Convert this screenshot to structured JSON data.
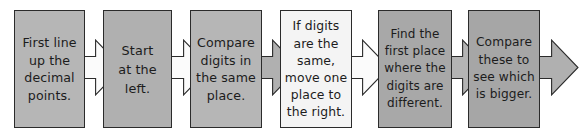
{
  "diagram": {
    "type": "linear-process-flow",
    "orientation": "left-to-right",
    "canvas": {
      "width": 581,
      "height": 138,
      "background": "#ffffff"
    },
    "palette": {
      "box_fill_gray": "#b3b3b3",
      "box_fill_light": "#f2f2f2",
      "box_stroke": "#2b2b2b",
      "arrow_fill_white": "#fbfbfb",
      "arrow_fill_gray": "#b0b0b0",
      "arrow_stroke": "#2b2b2b",
      "text_color": "#1c1c1c"
    },
    "steps": [
      {
        "index": 1,
        "name": "line-up-decimal-points",
        "text": "First line\nup the\ndecimal\npoints.",
        "fill": "#b6b6b6",
        "x": 14,
        "y": 10,
        "w": 71,
        "h": 118
      },
      {
        "index": 2,
        "name": "start-at-the-left",
        "text": "Start\nat the\nleft.",
        "fill": "#b0b0b0",
        "x": 103,
        "y": 10,
        "w": 69,
        "h": 118
      },
      {
        "index": 3,
        "name": "compare-digits-same-place",
        "text": "Compare\ndigits in\nthe same\nplace.",
        "fill": "#b6b6b6",
        "x": 190,
        "y": 10,
        "w": 72,
        "h": 118
      },
      {
        "index": 4,
        "name": "if-digits-same-move-right",
        "text": "If digits\nare the\nsame,\nmove one\nplace to\nthe right.",
        "fill": "#f4f4f4",
        "x": 280,
        "y": 10,
        "w": 72,
        "h": 118
      },
      {
        "index": 5,
        "name": "find-first-different-place",
        "text": "Find the\nfirst place\nwhere the\ndigits are\ndifferent.",
        "fill": "#a8a8a8",
        "x": 378,
        "y": 10,
        "w": 74,
        "h": 118
      },
      {
        "index": 6,
        "name": "compare-to-see-which-is-bigger",
        "text": "Compare\nthese to\nsee which\nis bigger.",
        "fill": "#a6a6a6",
        "x": 468,
        "y": 10,
        "w": 72,
        "h": 118
      }
    ],
    "connectors": [
      {
        "index": 1,
        "name": "arrow-step1-to-step2",
        "from": 1,
        "to": 2,
        "fill": "#fbfbfb",
        "x": 78,
        "y": 40,
        "w": 44,
        "h": 55
      },
      {
        "index": 2,
        "name": "arrow-step2-to-step3",
        "from": 2,
        "to": 3,
        "fill": "#fbfbfb",
        "x": 166,
        "y": 40,
        "w": 44,
        "h": 55
      },
      {
        "index": 3,
        "name": "arrow-step3-to-step4",
        "from": 3,
        "to": 4,
        "fill": "#b0b0b0",
        "x": 255,
        "y": 40,
        "w": 44,
        "h": 55
      },
      {
        "index": 4,
        "name": "arrow-step4-to-step5",
        "from": 4,
        "to": 5,
        "fill": "#fbfbfb",
        "x": 345,
        "y": 40,
        "w": 44,
        "h": 55
      },
      {
        "index": 5,
        "name": "arrow-step5-to-step6",
        "from": 5,
        "to": 6,
        "fill": "#b4b4b4",
        "x": 445,
        "y": 40,
        "w": 44,
        "h": 55
      },
      {
        "index": 6,
        "name": "arrow-step6-to-end",
        "from": 6,
        "to": null,
        "fill": "#b0b0b0",
        "x": 534,
        "y": 40,
        "w": 44,
        "h": 55
      }
    ]
  }
}
